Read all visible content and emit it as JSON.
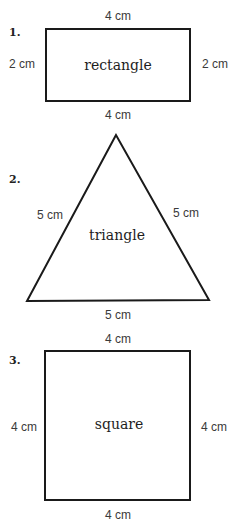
{
  "figures": [
    {
      "number": "1.",
      "shape": "rectangle",
      "name": "rectangle",
      "labels": {
        "top": "4 cm",
        "bottom": "4 cm",
        "left": "2 cm",
        "right": "2 cm"
      }
    },
    {
      "number": "2.",
      "shape": "triangle",
      "name": "triangle",
      "labels": {
        "left": "5 cm",
        "right": "5 cm",
        "bottom": "5 cm"
      }
    },
    {
      "number": "3.",
      "shape": "square",
      "name": "square",
      "labels": {
        "top": "4 cm",
        "bottom": "4 cm",
        "left": "4 cm",
        "right": "4 cm"
      }
    }
  ],
  "colors": {
    "stroke": "#1a1a1a",
    "label": "#3a3a3a",
    "background": "#ffffff"
  }
}
